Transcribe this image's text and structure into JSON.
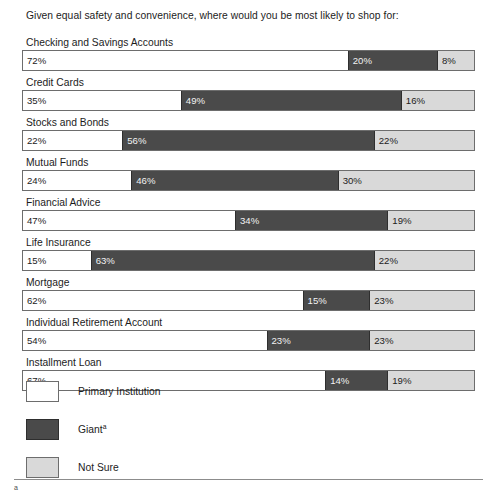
{
  "question": "Given equal safety and convenience, where would you be most likely to shop for:",
  "colors": {
    "primary_institution": "#ffffff",
    "giant": "#4a4a4a",
    "not_sure": "#d9d9d9",
    "border": "#6d6d6d",
    "text": "#1c1c1c"
  },
  "legend": {
    "items": [
      {
        "label": "Primary Institution",
        "swatch": "primary-institution-swatch"
      },
      {
        "label": "Giant",
        "superscript": "a",
        "swatch": "giant-swatch"
      },
      {
        "label": "Not Sure",
        "swatch": "not-sure-swatch"
      }
    ]
  },
  "footnote": {
    "mark": "a"
  },
  "rows": [
    {
      "label": "Checking and Savings Accounts",
      "primary": "72%",
      "giant": "20%",
      "not_sure": "8%"
    },
    {
      "label": "Credit Cards",
      "primary": "35%",
      "giant": "49%",
      "not_sure": "16%"
    },
    {
      "label": "Stocks and Bonds",
      "primary": "22%",
      "giant": "56%",
      "not_sure": "22%"
    },
    {
      "label": "Mutual Funds",
      "primary": "24%",
      "giant": "46%",
      "not_sure": "30%"
    },
    {
      "label": "Financial Advice",
      "primary": "47%",
      "giant": "34%",
      "not_sure": "19%"
    },
    {
      "label": "Life Insurance",
      "primary": "15%",
      "giant": "63%",
      "not_sure": "22%"
    },
    {
      "label": "Mortgage",
      "primary": "62%",
      "giant": "15%",
      "not_sure": "23%"
    },
    {
      "label": "Individual Retirement Account",
      "primary": "54%",
      "giant": "23%",
      "not_sure": "23%"
    },
    {
      "label": "Installment Loan",
      "primary": "67%",
      "giant": "14%",
      "not_sure": "19%"
    }
  ],
  "chart_data": {
    "type": "bar",
    "title": "Given equal safety and convenience, where would you be most likely to shop for:",
    "orientation": "horizontal",
    "stacked": true,
    "normalized": true,
    "xlabel": "",
    "ylabel": "",
    "xlim": [
      0,
      100
    ],
    "grid": false,
    "legend_position": "bottom-left",
    "categories": [
      "Checking and Savings Accounts",
      "Credit Cards",
      "Stocks and Bonds",
      "Mutual Funds",
      "Financial Advice",
      "Life Insurance",
      "Mortgage",
      "Individual Retirement Account",
      "Installment Loan"
    ],
    "series": [
      {
        "name": "Primary Institution",
        "color": "#ffffff",
        "values": [
          72,
          35,
          22,
          24,
          47,
          15,
          62,
          54,
          67
        ]
      },
      {
        "name": "Giant",
        "color": "#4a4a4a",
        "values": [
          20,
          49,
          56,
          46,
          34,
          63,
          15,
          23,
          14
        ]
      },
      {
        "name": "Not Sure",
        "color": "#d9d9d9",
        "values": [
          8,
          16,
          22,
          30,
          19,
          22,
          23,
          23,
          19
        ]
      }
    ],
    "data_labels": [
      {
        "category": "Checking and Savings Accounts",
        "Primary Institution": "72%",
        "Giant": "20%",
        "Not Sure": "8%"
      },
      {
        "category": "Credit Cards",
        "Primary Institution": "35%",
        "Giant": "49%",
        "Not Sure": "16%"
      },
      {
        "category": "Stocks and Bonds",
        "Primary Institution": "22%",
        "Giant": "56%",
        "Not Sure": "22%"
      },
      {
        "category": "Mutual Funds",
        "Primary Institution": "24%",
        "Giant": "46%",
        "Not Sure": "30%"
      },
      {
        "category": "Financial Advice",
        "Primary Institution": "47%",
        "Giant": "34%",
        "Not Sure": "19%"
      },
      {
        "category": "Life Insurance",
        "Primary Institution": "15%",
        "Giant": "63%",
        "Not Sure": "22%"
      },
      {
        "category": "Mortgage",
        "Primary Institution": "62%",
        "Giant": "15%",
        "Not Sure": "23%"
      },
      {
        "category": "Individual Retirement Account",
        "Primary Institution": "54%",
        "Giant": "23%",
        "Not Sure": "23%"
      },
      {
        "category": "Installment Loan",
        "Primary Institution": "67%",
        "Giant": "14%",
        "Not Sure": "19%"
      }
    ]
  }
}
